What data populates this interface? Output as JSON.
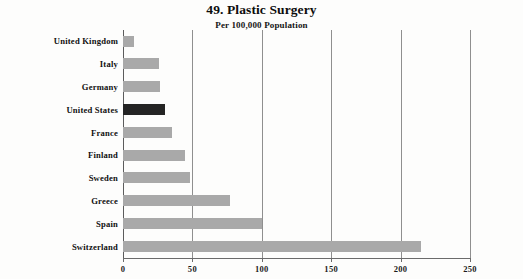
{
  "chart_data": {
    "type": "bar",
    "orientation": "horizontal",
    "title": "49. Plastic Surgery",
    "subtitle": "Per 100,000 Population",
    "xlabel": "",
    "ylabel": "",
    "xlim": [
      0,
      250
    ],
    "xticks": [
      0,
      50,
      100,
      150,
      200,
      250
    ],
    "xtick_labels": [
      "0",
      "50",
      "100",
      "150",
      "200",
      "250"
    ],
    "grid": true,
    "grid_axis": "x",
    "legend": false,
    "categories": [
      "United Kingdom",
      "Italy",
      "Germany",
      "United States",
      "France",
      "Finland",
      "Sweden",
      "Greece",
      "Spain",
      "Switzerland"
    ],
    "values": [
      8,
      26,
      27,
      30,
      35,
      45,
      48,
      77,
      100,
      215
    ],
    "highlighted_category": "United States",
    "colors": {
      "bar": "#a9a9a9",
      "bar_highlight": "#242424",
      "gridline": "#8f8f8f",
      "axis": "#6b6b6b",
      "text": "#101010",
      "background": "#fdfdfc"
    }
  }
}
